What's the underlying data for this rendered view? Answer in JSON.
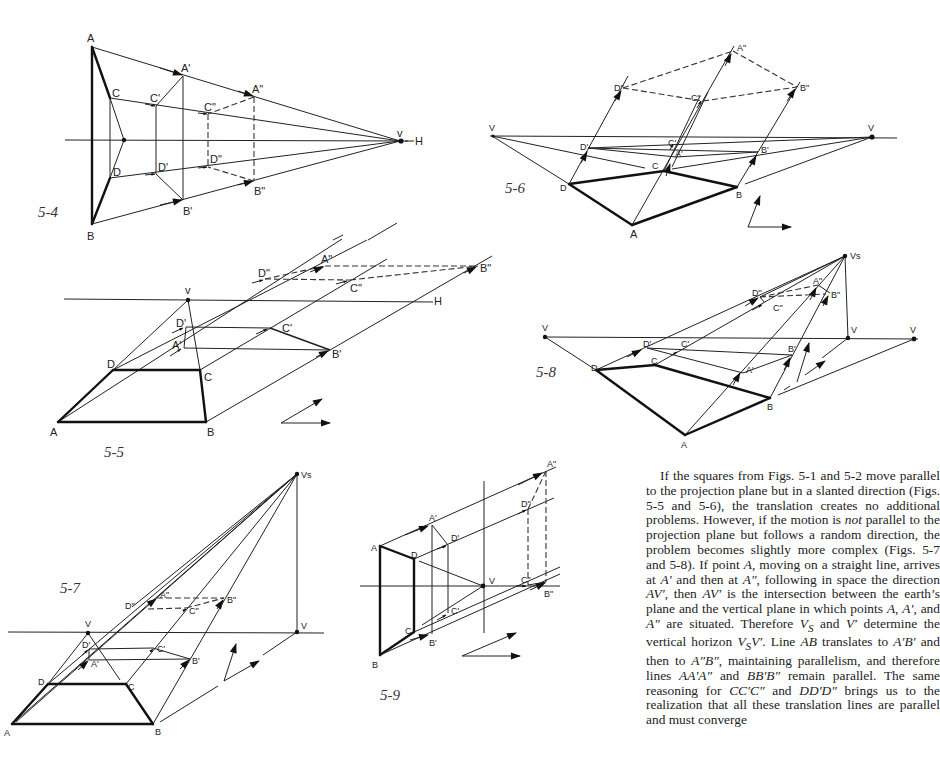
{
  "figures": [
    {
      "id": "5-4",
      "caption": "5-4",
      "points": [
        {
          "name": "A",
          "label": "A"
        },
        {
          "name": "B",
          "label": "B"
        },
        {
          "name": "C",
          "label": "C"
        },
        {
          "name": "D",
          "label": "D"
        },
        {
          "name": "A1",
          "label": "A'"
        },
        {
          "name": "B1",
          "label": "B'"
        },
        {
          "name": "C1",
          "label": "C'"
        },
        {
          "name": "D1",
          "label": "D'"
        },
        {
          "name": "A2",
          "label": "A\""
        },
        {
          "name": "B2",
          "label": "B\""
        },
        {
          "name": "C2",
          "label": "C\""
        },
        {
          "name": "D2",
          "label": "D\""
        },
        {
          "name": "V",
          "label": "v"
        },
        {
          "name": "H",
          "label": "H"
        }
      ]
    },
    {
      "id": "5-5",
      "caption": "5-5",
      "points": [
        {
          "name": "A",
          "label": "A"
        },
        {
          "name": "B",
          "label": "B"
        },
        {
          "name": "C",
          "label": "C"
        },
        {
          "name": "D",
          "label": "D"
        },
        {
          "name": "A1",
          "label": "A'"
        },
        {
          "name": "B1",
          "label": "B'"
        },
        {
          "name": "C1",
          "label": "C'"
        },
        {
          "name": "D1",
          "label": "D'"
        },
        {
          "name": "A2",
          "label": "A\""
        },
        {
          "name": "B2",
          "label": "B\""
        },
        {
          "name": "C2",
          "label": "C\""
        },
        {
          "name": "D2",
          "label": "D\""
        },
        {
          "name": "V",
          "label": "v"
        },
        {
          "name": "H",
          "label": "H"
        }
      ]
    },
    {
      "id": "5-6",
      "caption": "5-6",
      "points": [
        {
          "name": "A",
          "label": "A"
        },
        {
          "name": "B",
          "label": "B"
        },
        {
          "name": "C",
          "label": "C"
        },
        {
          "name": "D",
          "label": "D"
        },
        {
          "name": "A1",
          "label": "A'"
        },
        {
          "name": "B1",
          "label": "B'"
        },
        {
          "name": "C1",
          "label": "C'"
        },
        {
          "name": "D1",
          "label": "D'"
        },
        {
          "name": "A2",
          "label": "A\""
        },
        {
          "name": "B2",
          "label": "B\""
        },
        {
          "name": "C2",
          "label": "C\""
        },
        {
          "name": "D2",
          "label": "D\""
        },
        {
          "name": "VL",
          "label": "V"
        },
        {
          "name": "VR",
          "label": "V"
        }
      ]
    },
    {
      "id": "5-7",
      "caption": "5-7",
      "points": [
        {
          "name": "A",
          "label": "A"
        },
        {
          "name": "B",
          "label": "B"
        },
        {
          "name": "C",
          "label": "C"
        },
        {
          "name": "D",
          "label": "D"
        },
        {
          "name": "A1",
          "label": "A'"
        },
        {
          "name": "B1",
          "label": "B'"
        },
        {
          "name": "C1",
          "label": "C'"
        },
        {
          "name": "D1",
          "label": "D'"
        },
        {
          "name": "A2",
          "label": "A\""
        },
        {
          "name": "B2",
          "label": "B\""
        },
        {
          "name": "C2",
          "label": "C\""
        },
        {
          "name": "D2",
          "label": "D\""
        },
        {
          "name": "V",
          "label": "V"
        },
        {
          "name": "V2",
          "label": "V"
        },
        {
          "name": "VS",
          "label": "Vs"
        }
      ]
    },
    {
      "id": "5-8",
      "caption": "5-8",
      "points": [
        {
          "name": "A",
          "label": "A"
        },
        {
          "name": "B",
          "label": "B"
        },
        {
          "name": "C",
          "label": "C"
        },
        {
          "name": "D",
          "label": "D"
        },
        {
          "name": "A1",
          "label": "A'"
        },
        {
          "name": "B1",
          "label": "B'"
        },
        {
          "name": "C1",
          "label": "C'"
        },
        {
          "name": "D1",
          "label": "D'"
        },
        {
          "name": "A2",
          "label": "A\""
        },
        {
          "name": "B2",
          "label": "B\""
        },
        {
          "name": "C2",
          "label": "C\""
        },
        {
          "name": "D2",
          "label": "D\""
        },
        {
          "name": "VL",
          "label": "V"
        },
        {
          "name": "VM",
          "label": "V"
        },
        {
          "name": "VR",
          "label": "V"
        },
        {
          "name": "VS",
          "label": "Vs"
        }
      ]
    },
    {
      "id": "5-9",
      "caption": "5-9",
      "points": [
        {
          "name": "A",
          "label": "A"
        },
        {
          "name": "B",
          "label": "B"
        },
        {
          "name": "C",
          "label": "C"
        },
        {
          "name": "D",
          "label": "D"
        },
        {
          "name": "A1",
          "label": "A'"
        },
        {
          "name": "B1",
          "label": "B'"
        },
        {
          "name": "C1",
          "label": "C'"
        },
        {
          "name": "D1",
          "label": "D'"
        },
        {
          "name": "A2",
          "label": "A\""
        },
        {
          "name": "B2",
          "label": "B\""
        },
        {
          "name": "C2",
          "label": "C\""
        },
        {
          "name": "D2",
          "label": "D\""
        },
        {
          "name": "V",
          "label": "V"
        }
      ]
    }
  ],
  "body_text": {
    "p1_a": "If the squares from Figs. 5-1 and 5-2 move parallel to the projection plane but in a slanted direction (Figs. 5-5 and 5-6), the translation creates no additional problems. However, if the motion is ",
    "p1_not": "not",
    "p1_b": " parallel to the projection plane but follows a random direction, the problem becomes slightly more complex (Figs. 5-7 and 5-8). If point ",
    "p1_A": "A",
    "p1_c": ", moving on a straight line, arrives at ",
    "p1_A1": "A′",
    "p1_d": " and then at ",
    "p1_A2": "A″",
    "p1_e": ", following in space the direction ",
    "p1_AV1": "AV′",
    "p1_f": ", then ",
    "p1_AV2": "AV′",
    "p1_g": " is the intersection between the earth’s plane and the vertical plane in which points ",
    "p1_A3": "A",
    "p1_h": ", ",
    "p1_A4": "A′",
    "p1_i": ", and ",
    "p1_A5": "A″",
    "p1_j": " are situated. Therefore ",
    "p1_VS": "V",
    "p1_VS_sub": "S",
    "p1_k": " and ",
    "p1_V1": "V′",
    "p1_l": " determine the vertical horizon ",
    "p1_VSV": "V",
    "p1_VSV_sub": "S",
    "p1_VSV_b": "V′",
    "p1_m": ". Line ",
    "p1_AB": "AB",
    "p1_n": " translates to ",
    "p1_A1B1": "A′B′",
    "p1_o": " and then to ",
    "p1_A2B2": "A″B″",
    "p1_p": ", maintaining parallelism, and therefore lines ",
    "p1_AA": "AA′A″",
    "p1_q": " and ",
    "p1_BB": "BB′B″",
    "p1_r": " remain parallel. The same reasoning for ",
    "p1_CC": "CC′C″",
    "p1_s": " and ",
    "p1_DD": "DD′D″",
    "p1_t": " brings us to the realization that all these translation lines are parallel and must converge"
  }
}
